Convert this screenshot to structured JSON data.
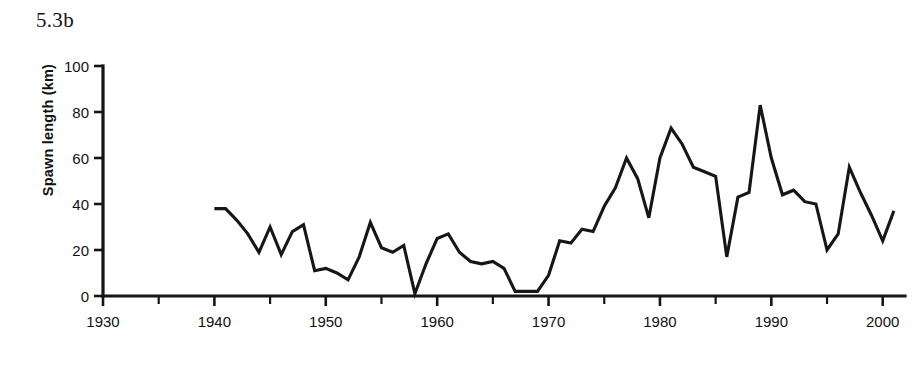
{
  "figure": {
    "panel_label": "5.3b"
  },
  "chart_data": {
    "type": "line",
    "title": "5.3b",
    "xlabel": "",
    "ylabel": "Spawn length (km)",
    "xlim": [
      1930,
      2002
    ],
    "ylim": [
      0,
      100
    ],
    "grid": false,
    "legend": null,
    "x_ticks_major": [
      1930,
      1940,
      1950,
      1960,
      1970,
      1980,
      1990,
      2000
    ],
    "x_ticks_minor": [
      1935,
      1945,
      1955,
      1965,
      1975,
      1985,
      1995
    ],
    "x_tick_labels": [
      "1930",
      "1940",
      "1950",
      "1960",
      "1970",
      "1980",
      "1990",
      "2000"
    ],
    "y_ticks": [
      0,
      20,
      40,
      60,
      80,
      100
    ],
    "y_tick_labels": [
      "0",
      "20",
      "40",
      "60",
      "80",
      "100"
    ],
    "series": [
      {
        "name": "Spawn length",
        "color": "#161616",
        "x": [
          1940,
          1941,
          1942,
          1943,
          1944,
          1945,
          1946,
          1947,
          1948,
          1949,
          1950,
          1951,
          1952,
          1953,
          1954,
          1955,
          1956,
          1957,
          1958,
          1959,
          1960,
          1961,
          1962,
          1963,
          1964,
          1965,
          1966,
          1967,
          1968,
          1969,
          1970,
          1971,
          1972,
          1973,
          1974,
          1975,
          1976,
          1977,
          1978,
          1979,
          1980,
          1981,
          1982,
          1983,
          1984,
          1985,
          1986,
          1987,
          1988,
          1989,
          1990,
          1991,
          1992,
          1993,
          1994,
          1995,
          1996,
          1997,
          1998,
          1999,
          2000,
          2001
        ],
        "y": [
          38,
          38,
          33,
          27,
          19,
          30,
          18,
          28,
          31,
          11,
          12,
          10,
          7,
          17,
          32,
          21,
          19,
          22,
          1,
          14,
          25,
          27,
          19,
          15,
          14,
          15,
          12,
          2,
          2,
          2,
          9,
          24,
          23,
          29,
          28,
          39,
          47,
          60,
          51,
          34,
          60,
          73,
          66,
          56,
          54,
          52,
          17,
          43,
          45,
          83,
          60,
          44,
          46,
          41,
          40,
          20,
          27,
          56,
          45,
          35,
          24,
          37
        ]
      }
    ]
  }
}
